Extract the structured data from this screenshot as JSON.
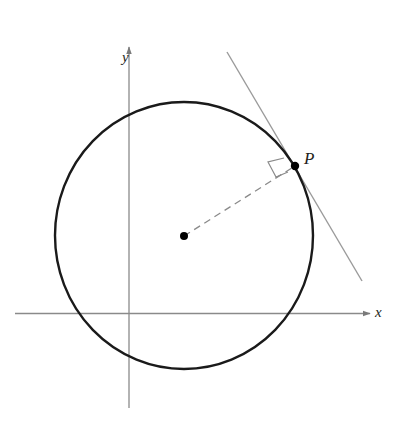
{
  "diagram": {
    "type": "geometry",
    "labels": {
      "x_axis": "x",
      "y_axis": "y",
      "point": "P"
    },
    "colors": {
      "axis": "#8a8a8a",
      "circle": "#1a1a1a",
      "tangent": "#9a9a9a",
      "radius": "#8a8a8a",
      "point": "#000000",
      "text": "#231f20"
    },
    "elements": {
      "axes": {
        "x_axis_y": 313,
        "x_from": 15,
        "x_to": 372,
        "y_axis_x": 129,
        "y_from": 408,
        "y_to": 44
      },
      "circle": {
        "cx": 184,
        "cy": 235,
        "rx": 129,
        "ry": 133
      },
      "center_point": {
        "x": 184,
        "y": 236
      },
      "tangent_point_P": {
        "x": 295,
        "y": 166
      },
      "tangent_line": {
        "x1": 227,
        "y1": 52,
        "x2": 362,
        "y2": 281
      },
      "radius_segment": {
        "style": "dashed",
        "from": "center",
        "to": "P"
      },
      "right_angle_marker": true
    }
  }
}
